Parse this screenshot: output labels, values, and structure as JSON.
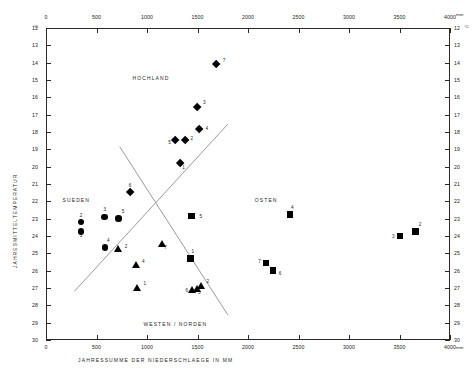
{
  "chart_data": {
    "type": "scatter",
    "title": "",
    "xlabel": "JAHRESSUMME  DER  NIEDERSCHLAEGE  IN  MM",
    "ylabel": "JAHRESMITTELTEMPERATUR",
    "x_unit": "mm",
    "y_unit": "°C",
    "xlim": [
      0,
      4000
    ],
    "ylim": [
      12,
      30
    ],
    "y_inverted": true,
    "grid": false,
    "legend_position": "none",
    "xticks": [
      0,
      500,
      1000,
      1500,
      2000,
      2500,
      3000,
      3500,
      4000
    ],
    "xtick_labels": [
      "0",
      "500",
      "1000",
      "1500",
      "2000",
      "2500",
      "3000",
      "3500",
      "4000"
    ],
    "yticks": [
      12,
      13,
      14,
      15,
      16,
      17,
      18,
      19,
      20,
      21,
      22,
      23,
      24,
      25,
      26,
      27,
      28,
      29,
      30
    ],
    "ytick_labels": [
      "12",
      "13",
      "14",
      "15",
      "16",
      "17",
      "18",
      "19",
      "20",
      "21",
      "22",
      "23",
      "24",
      "25",
      "26",
      "27",
      "28",
      "29",
      "30"
    ],
    "annotations": [
      {
        "text": "HOCHLAND",
        "x": 1040,
        "y": 14.9
      },
      {
        "text": "SUEDEN",
        "x": 300,
        "y": 21.9
      },
      {
        "text": "OSTEN",
        "x": 2180,
        "y": 21.9
      },
      {
        "text": "WESTEN  /  NORDEN",
        "x": 1280,
        "y": 29.1
      }
    ],
    "dividers": [
      {
        "name": "divider-sw-ne",
        "x1": 280,
        "y1": 18.85,
        "x2": 1760,
        "y2": 28.35
      },
      {
        "name": "divider-nw-se",
        "x1": 730,
        "y1": 18.85,
        "x2": 1800,
        "y2": 28.55
      }
    ],
    "series": [
      {
        "name": "Hochland",
        "marker": "diamond",
        "points": [
          {
            "label": "7",
            "x": 1690,
            "y": 14.1
          },
          {
            "label": "3",
            "x": 1495,
            "y": 16.55
          },
          {
            "label": "4",
            "x": 1520,
            "y": 17.85
          },
          {
            "label": "2",
            "x": 1380,
            "y": 18.45
          },
          {
            "label": "5",
            "x": 1280,
            "y": 18.45
          },
          {
            "label": "1",
            "x": 1330,
            "y": 19.8
          },
          {
            "label": "6",
            "x": 830,
            "y": 21.5
          }
        ]
      },
      {
        "name": "Sueden",
        "marker": "circle",
        "points": [
          {
            "label": "2",
            "x": 345,
            "y": 23.2
          },
          {
            "label": "1",
            "x": 345,
            "y": 23.75
          },
          {
            "label": "3",
            "x": 580,
            "y": 22.9
          },
          {
            "label": "5",
            "x": 720,
            "y": 23.0
          },
          {
            "label": "4",
            "x": 585,
            "y": 24.65
          }
        ]
      },
      {
        "name": "Westen / Norden",
        "marker": "triangle",
        "points": [
          {
            "label": "2",
            "x": 720,
            "y": 24.75
          },
          {
            "label": "7",
            "x": 1150,
            "y": 24.45
          },
          {
            "label": "4",
            "x": 890,
            "y": 25.65
          },
          {
            "label": "1",
            "x": 905,
            "y": 27.0
          },
          {
            "label": "6",
            "x": 1450,
            "y": 27.1
          },
          {
            "label": "3",
            "x": 1495,
            "y": 27.05
          },
          {
            "label": "2",
            "x": 1540,
            "y": 26.85
          }
        ]
      },
      {
        "name": "Osten",
        "marker": "square",
        "points": [
          {
            "label": "5",
            "x": 1440,
            "y": 22.85
          },
          {
            "label": "1",
            "x": 1430,
            "y": 25.3
          },
          {
            "label": "4",
            "x": 2415,
            "y": 22.75
          },
          {
            "label": "7",
            "x": 2180,
            "y": 25.55
          },
          {
            "label": "6",
            "x": 2245,
            "y": 26.0
          },
          {
            "label": "3",
            "x": 3505,
            "y": 24.0
          },
          {
            "label": "2",
            "x": 3660,
            "y": 23.75
          }
        ]
      }
    ]
  }
}
